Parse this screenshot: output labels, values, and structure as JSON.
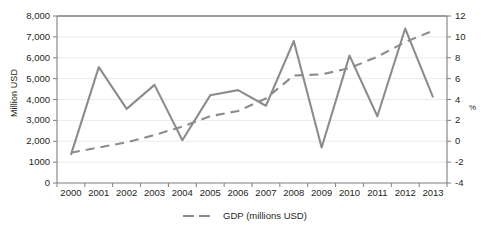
{
  "chart_data": {
    "type": "line",
    "title": "",
    "xlabel": "",
    "ylabel": "Million USD",
    "y2label": "%",
    "categories": [
      "2000",
      "2001",
      "2002",
      "2003",
      "2004",
      "2005",
      "2006",
      "2007",
      "2008",
      "2009",
      "2010",
      "2011",
      "2012",
      "2013"
    ],
    "x": [
      2000,
      2001,
      2002,
      2003,
      2004,
      2005,
      2006,
      2007,
      2008,
      2009,
      2010,
      2011,
      2012,
      2013
    ],
    "ylim": [
      0,
      8000
    ],
    "y2lim": [
      -4,
      12
    ],
    "grid": true,
    "legend_position": "bottom-center",
    "series": [
      {
        "name": "",
        "axis": "left",
        "style": "solid",
        "color": "#8c8c8c",
        "in_legend": false,
        "values": [
          1350,
          5550,
          3550,
          4700,
          2050,
          4200,
          4450,
          3700,
          6800,
          1700,
          6100,
          3200,
          7400,
          4100
        ]
      },
      {
        "name": "GDP (millions USD)",
        "axis": "right",
        "style": "dashed",
        "color": "#8c8c8c",
        "in_legend": true,
        "values": [
          -1.1,
          -0.6,
          -0.1,
          0.6,
          1.4,
          2.4,
          2.9,
          4.1,
          6.3,
          6.4,
          7.0,
          8.1,
          9.5,
          10.6
        ]
      }
    ],
    "y_ticks_left": [
      {
        "value": 8000,
        "label": "8,000"
      },
      {
        "value": 7000,
        "label": "7,000"
      },
      {
        "value": 6000,
        "label": "6,000"
      },
      {
        "value": 5000,
        "label": "5,000"
      },
      {
        "value": 4000,
        "label": "4,000"
      },
      {
        "value": 3000,
        "label": "3,000"
      },
      {
        "value": 2000,
        "label": "2,000"
      },
      {
        "value": 1000,
        "label": "1000"
      },
      {
        "value": 0,
        "label": "0"
      }
    ],
    "y_ticks_right": [
      {
        "value": 12,
        "label": "12"
      },
      {
        "value": 10,
        "label": "10"
      },
      {
        "value": 8,
        "label": "8"
      },
      {
        "value": 6,
        "label": "6"
      },
      {
        "value": 4,
        "label": "4"
      },
      {
        "value": 2,
        "label": "2"
      },
      {
        "value": 0,
        "label": "0"
      },
      {
        "value": -2,
        "label": "-2"
      },
      {
        "value": -4,
        "label": "-4"
      }
    ],
    "legend_entries": [
      {
        "label": "GDP (millions USD)",
        "style": "dashed",
        "color": "#8c8c8c"
      }
    ]
  },
  "colors": {
    "line": "#8c8c8c",
    "axis": "#7f7f7f",
    "grid": "#ebebeb",
    "text": "#231f20",
    "background": "#ffffff"
  }
}
